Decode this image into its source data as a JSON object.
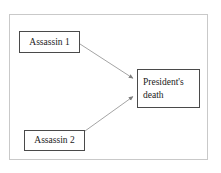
{
  "diagram": {
    "frame": {
      "border_color": "#c9c9c9",
      "background": "#ffffff"
    },
    "node_border_color": "#4a4a4a",
    "edge_color": "#8a8a8a",
    "text_color": "#1a1a1a",
    "nodes": [
      {
        "id": "assassin-1",
        "label": "Assassin 1",
        "x": 19,
        "y": 31,
        "width": 61,
        "height": 22
      },
      {
        "id": "assassin-2",
        "label": "Assassin 2",
        "x": 24,
        "y": 130,
        "width": 61,
        "height": 21
      },
      {
        "id": "president-death",
        "label_line_1": "President's",
        "label_line_2": "death",
        "x": 137,
        "y": 69,
        "width": 63,
        "height": 39
      }
    ],
    "edges": [
      {
        "id": "edge-assassin1-to-death",
        "from": "assassin-1",
        "to": "president-death",
        "x1": 80,
        "y1": 44,
        "x2": 135,
        "y2": 79,
        "arrowhead": "filled-triangle"
      },
      {
        "id": "edge-assassin2-to-death",
        "from": "assassin-2",
        "to": "president-death",
        "x1": 85,
        "y1": 131,
        "x2": 135,
        "y2": 96,
        "arrowhead": "filled-triangle"
      }
    ]
  }
}
